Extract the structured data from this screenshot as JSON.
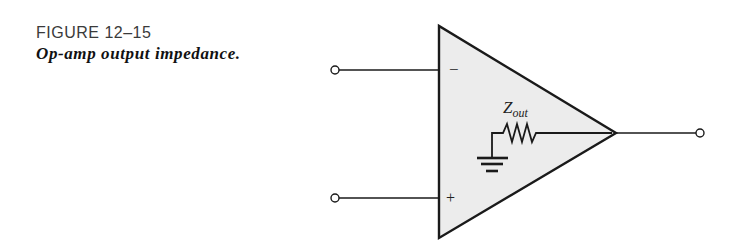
{
  "figure": {
    "number": "FIGURE 12–15",
    "title": "Op-amp output impedance."
  },
  "diagram": {
    "component": "op-amp",
    "inverting_input_label": "−",
    "noninverting_input_label": "+",
    "output_impedance": {
      "symbol": "Z",
      "subscript": "out"
    },
    "elements": [
      "inverting-input-terminal",
      "noninverting-input-terminal",
      "output-terminal",
      "op-amp-triangle",
      "output-resistor-Zout",
      "ground-symbol"
    ],
    "colors": {
      "triangle_fill": "#ececec",
      "stroke": "#1a1a1a"
    }
  }
}
